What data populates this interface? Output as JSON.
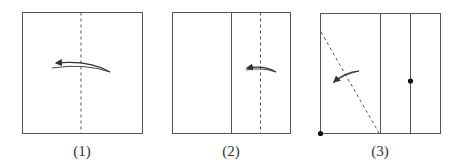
{
  "figure": {
    "panels": [
      {
        "label": "(1)",
        "description": "Square with dashed vertical center fold line; curved arrow folding right side to left"
      },
      {
        "label": "(2)",
        "description": "Square with solid vertical center line and dashed fold line on right half; curved arrow folding leftward"
      },
      {
        "label": "(3)",
        "description": "Square with two solid vertical lines on right, diagonal dashed fold line on left; dot markers at bottom-left corner and on right vertical line; curved arrow folding leftward"
      }
    ],
    "colors": {
      "stroke": "#444444",
      "background": "#ffffff",
      "dot": "#111111"
    }
  }
}
